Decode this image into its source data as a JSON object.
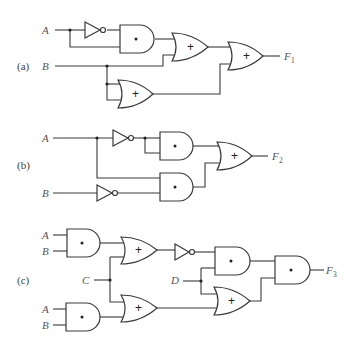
{
  "diagram": {
    "parts": [
      {
        "label": "(a)",
        "inputs": [
          "A",
          "B"
        ],
        "output": {
          "name": "F",
          "subscript": "1"
        },
        "gates": [
          "NOT",
          "AND",
          "OR",
          "OR",
          "OR"
        ],
        "symbols": {
          "and": "•",
          "or": "+"
        }
      },
      {
        "label": "(b)",
        "inputs": [
          "A",
          "B"
        ],
        "output": {
          "name": "F",
          "subscript": "2"
        },
        "gates": [
          "NOT",
          "NOT",
          "AND",
          "AND",
          "OR"
        ],
        "symbols": {
          "and": "•",
          "or": "+"
        }
      },
      {
        "label": "(c)",
        "inputs": [
          "A",
          "B",
          "C",
          "D",
          "A",
          "B"
        ],
        "output": {
          "name": "F",
          "subscript": "3"
        },
        "gates": [
          "AND",
          "AND",
          "OR",
          "OR",
          "NOT",
          "AND",
          "OR",
          "AND"
        ],
        "symbols": {
          "and": "•",
          "or": "+"
        }
      }
    ]
  }
}
